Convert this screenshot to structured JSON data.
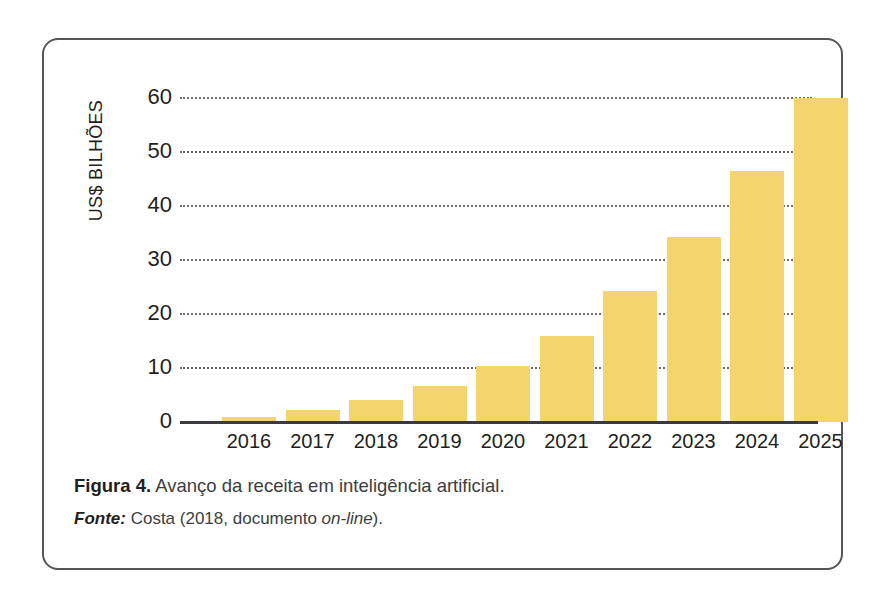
{
  "figure": {
    "caption_prefix": "Figura 4.",
    "caption_text": " Avanço da receita em inteligência artificial.",
    "source_prefix": "Fonte:",
    "source_text_a": " Costa (2018, documento ",
    "source_text_italic": "on-line",
    "source_text_b": ")."
  },
  "colors": {
    "bar_fill": "#f4d46c",
    "axis": "#3b3b3f",
    "gridline": "#6a6a6e",
    "border": "#55565a",
    "text": "#231f20"
  },
  "chart_data": {
    "type": "bar",
    "title": "",
    "xlabel": "",
    "ylabel": "US$ BILHÕES",
    "categories": [
      "2016",
      "2017",
      "2018",
      "2019",
      "2020",
      "2021",
      "2022",
      "2023",
      "2024",
      "2025"
    ],
    "values": [
      1.0,
      2.2,
      4.0,
      6.7,
      10.3,
      16.0,
      24.2,
      34.2,
      46.4,
      60.0
    ],
    "ylim": [
      0,
      60
    ],
    "yticks": [
      0,
      10,
      20,
      30,
      40,
      50,
      60
    ],
    "ytick_labels": [
      "0",
      "10",
      "20",
      "30",
      "40",
      "50",
      "60"
    ],
    "grid": true,
    "grid_style": "dotted-horizontal",
    "legend": false,
    "series": [
      {
        "name": "Receita em inteligência artificial",
        "values": [
          1.0,
          2.2,
          4.0,
          6.7,
          10.3,
          16.0,
          24.2,
          34.2,
          46.4,
          60.0
        ]
      }
    ]
  }
}
